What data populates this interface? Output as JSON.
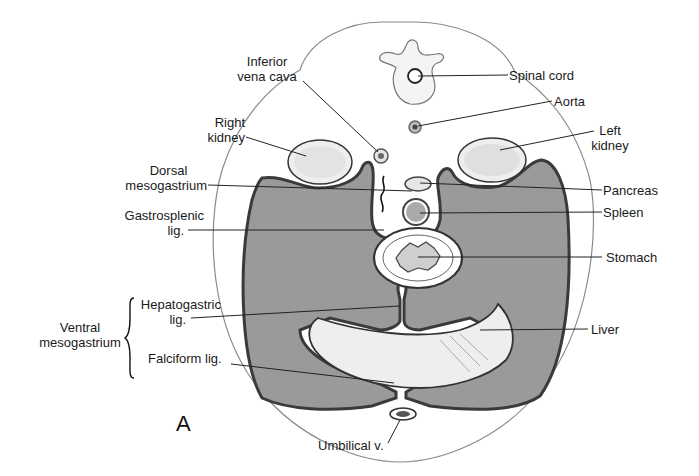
{
  "figure": {
    "panel_letter": "A",
    "colors": {
      "body_outline": "#8a8a8a",
      "peritoneal_cavity": "#9a9a9a",
      "cavity_border": "#3a3a3a",
      "organ_fill": "#f2f2f2",
      "background": "#ffffff"
    },
    "labels": {
      "ivc_line1": "Inferior",
      "ivc_line2": "vena cava",
      "right_kidney_line1": "Right",
      "right_kidney_line2": "kidney",
      "dorsal_meso_line1": "Dorsal",
      "dorsal_meso_line2": "mesogastrium",
      "gastrosplenic_line1": "Gastrosplenic",
      "gastrosplenic_line2": "lig.",
      "hepatogastric_line1": "Hepatogastric",
      "hepatogastric_line2": "lig.",
      "ventral_meso_line1": "Ventral",
      "ventral_meso_line2": "mesogastrium",
      "falciform": "Falciform lig.",
      "umbilical": "Umbilical v.",
      "spinal_cord": "Spinal cord",
      "aorta": "Aorta",
      "left_kidney_line1": "Left",
      "left_kidney_line2": "kidney",
      "pancreas": "Pancreas",
      "spleen": "Spleen",
      "stomach": "Stomach",
      "liver": "Liver"
    }
  }
}
